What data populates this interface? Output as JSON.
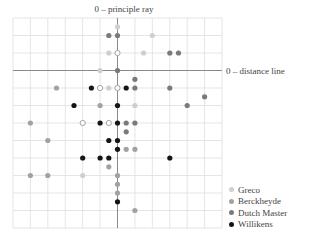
{
  "chart_data": {
    "type": "scatter",
    "title": "0 – principle ray",
    "xlabel": "",
    "ylabel": "",
    "right_axis_label": "0 – distance line",
    "grid": true,
    "xlim": [
      -6,
      6
    ],
    "ylim": [
      -9,
      3
    ],
    "x_axis_line": "0 – distance line",
    "y_axis_line": "0 – principle ray",
    "legend_position": "bottom-right",
    "series": [
      {
        "name": "Greco",
        "color": "#cfcfcf",
        "points": [
          [
            0,
            2.5
          ],
          [
            2,
            2
          ],
          [
            -0.5,
            1
          ],
          [
            1.5,
            1
          ],
          [
            -1,
            0
          ],
          [
            -0.5,
            -1
          ],
          [
            1,
            -2
          ],
          [
            -2,
            -6
          ]
        ]
      },
      {
        "name": "Greco (open)",
        "color": "#ffffff",
        "stroke": "#9a9a9a",
        "legend": false,
        "points": [
          [
            0,
            1
          ],
          [
            -1,
            -1
          ],
          [
            0,
            -1
          ],
          [
            -2,
            -3
          ],
          [
            -0.5,
            -3
          ]
        ]
      },
      {
        "name": "Berckheyde",
        "color": "#a2a2a2",
        "points": [
          [
            -3.5,
            -1
          ],
          [
            -1,
            -2
          ],
          [
            -5,
            -3
          ],
          [
            -4,
            -4
          ],
          [
            0.5,
            -4.5
          ],
          [
            1,
            -4.5
          ],
          [
            -0.5,
            -5.5
          ],
          [
            -5,
            -6
          ],
          [
            -4,
            -6
          ],
          [
            0,
            -6
          ],
          [
            0,
            -6.5
          ],
          [
            0,
            -7
          ],
          [
            1,
            -8
          ]
        ]
      },
      {
        "name": "Dutch Master",
        "color": "#7a7a7a",
        "points": [
          [
            -0.5,
            2
          ],
          [
            0,
            2
          ],
          [
            3,
            1
          ],
          [
            3.5,
            1
          ],
          [
            0,
            0
          ],
          [
            1,
            -0.5
          ],
          [
            1,
            -1
          ],
          [
            3,
            -1
          ],
          [
            5,
            -1.5
          ],
          [
            4,
            -2
          ],
          [
            0.5,
            -3
          ],
          [
            1,
            -3
          ],
          [
            0.5,
            -3.5
          ]
        ]
      },
      {
        "name": "Willikens",
        "color": "#151515",
        "points": [
          [
            -1.5,
            -1
          ],
          [
            0.5,
            -1
          ],
          [
            -2.5,
            -2
          ],
          [
            0,
            -2
          ],
          [
            -1,
            -3
          ],
          [
            0,
            -3
          ],
          [
            -0.5,
            -4
          ],
          [
            0,
            -4
          ],
          [
            0,
            -4.5
          ],
          [
            -2,
            -5
          ],
          [
            -1,
            -5
          ],
          [
            -0.5,
            -5
          ],
          [
            3,
            -5
          ],
          [
            0,
            -7.5
          ]
        ]
      }
    ]
  },
  "labels": {
    "title": "0 – principle ray",
    "distance_line": "0 – distance line"
  },
  "legend": {
    "items": [
      {
        "label": "Greco",
        "color": "#cfcfcf"
      },
      {
        "label": "Berckheyde",
        "color": "#a2a2a2"
      },
      {
        "label": "Dutch Master",
        "color": "#7a7a7a"
      },
      {
        "label": "Willikens",
        "color": "#151515"
      }
    ]
  }
}
